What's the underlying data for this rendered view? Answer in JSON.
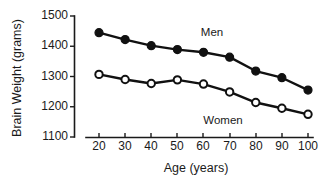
{
  "chart_data": {
    "type": "line",
    "title": "",
    "xlabel": "Age (years)",
    "ylabel": "Brain Weight (grams)",
    "x": [
      20,
      30,
      40,
      50,
      60,
      70,
      80,
      90,
      100
    ],
    "xticklabels": [
      "20",
      "30",
      "40",
      "50",
      "60",
      "70",
      "80",
      "90",
      "100"
    ],
    "yticklabels": [
      "1500",
      "1400",
      "1300",
      "1200",
      "1100"
    ],
    "yticks": [
      1500,
      1400,
      1300,
      1200,
      1100
    ],
    "xlim": [
      14,
      106
    ],
    "ylim": [
      1100,
      1500
    ],
    "grid": false,
    "legend": "inline-annotations",
    "series": [
      {
        "name": "Men",
        "marker": "filled-circle",
        "color": "#111111",
        "label_position": "above-right",
        "values": [
          1445,
          1422,
          1402,
          1389,
          1380,
          1364,
          1318,
          1296,
          1255
        ]
      },
      {
        "name": "Women",
        "marker": "open-circle",
        "color": "#111111",
        "label_position": "below-center",
        "values": [
          1307,
          1290,
          1277,
          1289,
          1275,
          1249,
          1214,
          1195,
          1175
        ]
      }
    ],
    "annotations": [
      {
        "text": "Men",
        "x": 72,
        "y": 1425
      },
      {
        "text": "Women",
        "x": 76,
        "y": 1163
      }
    ]
  }
}
